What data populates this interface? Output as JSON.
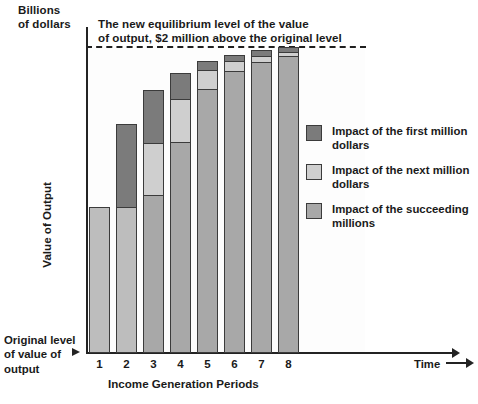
{
  "figure": {
    "unit_label": "Billions\nof dollars",
    "annotation": "The new equilibrium level of the value\nof output, $2 million above the original level",
    "origin_note": "Original level\nof value of\noutput",
    "time_label": "Time"
  },
  "legend": {
    "items": [
      {
        "label": "Impact of the first million\ndollars",
        "color": "#7b7b7b",
        "key": "first-million"
      },
      {
        "label": "Impact of the next million\ndollars",
        "color": "#cfcfcf",
        "key": "next-million"
      },
      {
        "label": "Impact of the succeeding\nmillions",
        "color": "#a8a8a8",
        "key": "succeeding-millions"
      }
    ]
  },
  "chart_data": {
    "type": "bar",
    "title": "",
    "subtitle": "The new equilibrium level of the value of output, $2 million above the original level",
    "xlabel": "Income Generation Periods",
    "ylabel": "Value of Output",
    "ylim": [
      0,
      5.1
    ],
    "ylim_unit": "Billions of dollars",
    "grid": false,
    "stacked": true,
    "legend_position": "right",
    "categories": [
      "1",
      "2",
      "3",
      "4",
      "5",
      "6",
      "7",
      "8"
    ],
    "series": [
      {
        "name": "Impact of the succeeding millions",
        "color": "#a8a8a8",
        "values": [
          2.4,
          2.4,
          2.6,
          3.47,
          4.34,
          4.64,
          4.78,
          4.88
        ]
      },
      {
        "name": "Impact of the next million",
        "color": "#cfcfcf",
        "values": [
          0.0,
          0.0,
          0.85,
          0.71,
          0.31,
          0.16,
          0.1,
          0.07
        ]
      },
      {
        "name": "Impact of the first million",
        "color": "#7b7b7b",
        "values": [
          0.0,
          1.37,
          0.87,
          0.43,
          0.15,
          0.1,
          0.08,
          0.07
        ]
      }
    ],
    "totals": [
      2.4,
      3.77,
      4.32,
      4.61,
      4.8,
      4.9,
      4.96,
      5.02
    ],
    "equilibrium_line": 5.05,
    "annotations": [
      {
        "text": "The new equilibrium level of the value of output, $2 million above the original level",
        "type": "dashed-reference-line"
      },
      {
        "text": "Original level of value of output",
        "type": "axis-origin-marker"
      },
      {
        "text": "Time",
        "type": "x-axis-direction"
      },
      {
        "text": "Billions of dollars",
        "type": "y-axis-unit"
      }
    ]
  },
  "geometry": {
    "baseline_y": 353,
    "bar_width": 21,
    "bars": [
      {
        "x": 89,
        "first": null,
        "next": null,
        "succ": null,
        "base": [
          207,
          353
        ]
      },
      {
        "x": 116,
        "first": [
          124,
          208
        ],
        "next": null,
        "succ": null,
        "base": [
          207,
          353
        ]
      },
      {
        "x": 143,
        "first": [
          90,
          144
        ],
        "next": [
          143,
          196
        ],
        "succ": [
          195,
          353
        ],
        "base": null
      },
      {
        "x": 170,
        "first": [
          73,
          100
        ],
        "next": [
          99,
          143
        ],
        "succ": [
          142,
          353
        ],
        "base": null
      },
      {
        "x": 197,
        "first": [
          61,
          71
        ],
        "next": [
          70,
          90
        ],
        "succ": [
          89,
          353
        ],
        "base": null
      },
      {
        "x": 224,
        "first": [
          55,
          62
        ],
        "next": [
          61,
          72
        ],
        "succ": [
          71,
          353
        ],
        "base": null
      },
      {
        "x": 251,
        "first": [
          50,
          57
        ],
        "next": [
          56,
          63
        ],
        "succ": [
          62,
          353
        ],
        "base": null
      },
      {
        "x": 278,
        "first": [
          47,
          53
        ],
        "next": [
          52,
          57
        ],
        "succ": [
          56,
          353
        ],
        "base": null
      }
    ]
  }
}
